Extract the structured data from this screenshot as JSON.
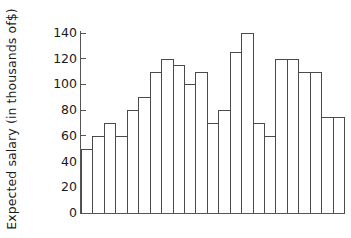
{
  "chart_data": {
    "type": "bar",
    "title": "",
    "xlabel": "",
    "ylabel": "Expected salary (in thousands of$)",
    "ylim": [
      0,
      140
    ],
    "ytick_labels": [
      "140",
      "120",
      "100",
      "80",
      "60",
      "40",
      "20",
      "0"
    ],
    "ytick_values": [
      140,
      120,
      100,
      80,
      60,
      40,
      20,
      0
    ],
    "grid": false,
    "legend": null,
    "categories": [
      "1",
      "2",
      "3",
      "4",
      "5",
      "6",
      "7",
      "8",
      "9",
      "10",
      "11",
      "12",
      "13",
      "14",
      "15",
      "16",
      "17",
      "18",
      "19",
      "20",
      "21",
      "22",
      "23"
    ],
    "values": [
      50,
      60,
      70,
      60,
      80,
      90,
      110,
      120,
      115,
      100,
      110,
      70,
      80,
      125,
      140,
      70,
      60,
      120,
      120,
      110,
      110,
      75,
      75
    ],
    "xtick_labels": [],
    "bar_fill_color": "#ffffff",
    "bar_edge_color": "#4a4a4a",
    "axis_color": "#555555",
    "text_color": "#1a1a1a"
  }
}
